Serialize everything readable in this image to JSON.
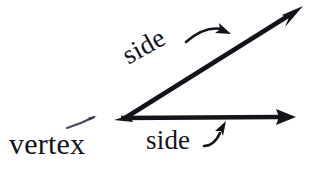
{
  "figure": {
    "type": "angle-diagram",
    "background_color": "#ffffff",
    "ink_color": "#14131a",
    "width": 313,
    "height": 174,
    "labels": {
      "vertex": "vertex",
      "side_upper": "side",
      "side_lower": "side"
    },
    "geometry": {
      "vertex_point": [
        125,
        118
      ],
      "ray_upper_end": [
        302,
        7
      ],
      "ray_lower_end": [
        296,
        117
      ],
      "ray_upper_angle_deg": -32,
      "ray_lower_angle_deg": 0
    },
    "pointers": {
      "vertex_pointer": "thin line from label toward vertex",
      "side_upper_pointer": "curved arrow from label to upper ray",
      "side_lower_pointer": "curved arrow from label to lower ray"
    }
  }
}
